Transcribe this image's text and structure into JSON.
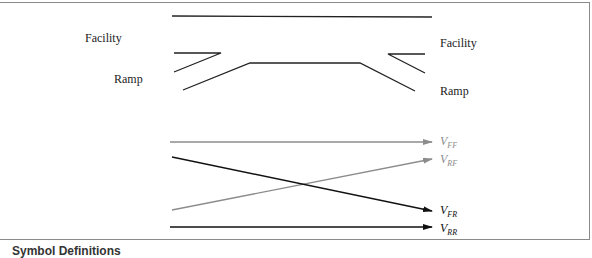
{
  "diagram": {
    "left_labels": {
      "facility": "Facility",
      "ramp": "Ramp"
    },
    "right_labels": {
      "facility": "Facility",
      "ramp": "Ramp"
    },
    "flows": [
      {
        "id": "FF",
        "main": "V",
        "sub": "FF",
        "color": "#8c8c8c"
      },
      {
        "id": "RF",
        "main": "V",
        "sub": "RF",
        "color": "#8c8c8c"
      },
      {
        "id": "FR",
        "main": "V",
        "sub": "FR",
        "color": "#111111"
      },
      {
        "id": "RR",
        "main": "V",
        "sub": "RR",
        "color": "#111111"
      }
    ],
    "caption": "Symbol Definitions"
  }
}
